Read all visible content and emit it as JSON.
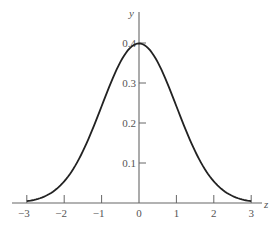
{
  "chart_data": {
    "type": "line",
    "title": "",
    "xlabel": "z",
    "ylabel": "y",
    "x_ticks": [
      "−3",
      "−2",
      "−1",
      "0",
      "1",
      "2",
      "3"
    ],
    "x_tick_values": [
      -3,
      -2,
      -1,
      0,
      1,
      2,
      3
    ],
    "y_ticks": [
      "0.1",
      "0.2",
      "0.3",
      "0.4"
    ],
    "y_tick_values": [
      0.1,
      0.2,
      0.3,
      0.4
    ],
    "xlim": [
      -3,
      3
    ],
    "ylim": [
      0,
      0.4
    ],
    "grid": false,
    "legend": null,
    "series": [
      {
        "name": "standard normal density",
        "x": [
          -3,
          -2.5,
          -2,
          -1.5,
          -1,
          -0.5,
          0,
          0.5,
          1,
          1.5,
          2,
          2.5,
          3
        ],
        "values": [
          0.0044,
          0.0175,
          0.054,
          0.1295,
          0.242,
          0.3521,
          0.3989,
          0.3521,
          0.242,
          0.1295,
          0.054,
          0.0175,
          0.0044
        ]
      }
    ]
  },
  "style": {
    "curve_color": "#222222",
    "axis_color": "#666666",
    "text_color": "#555555"
  }
}
